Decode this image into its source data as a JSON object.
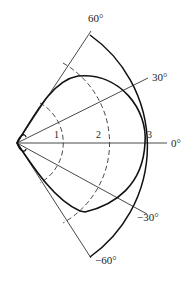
{
  "diagram": {
    "type": "polar radiation pattern",
    "origin": [
      17,
      143
    ],
    "angle_labels": [
      {
        "text": "60°",
        "angle": 60,
        "x": 88,
        "y": 22
      },
      {
        "text": "30°",
        "angle": 30,
        "x": 152,
        "y": 80
      },
      {
        "text": "0°",
        "angle": 0,
        "x": 171,
        "y": 148
      },
      {
        "text": "−30°",
        "angle": -30,
        "x": 137,
        "y": 221
      },
      {
        "text": "−60°",
        "angle": -60,
        "x": 95,
        "y": 263
      }
    ],
    "curve_labels": [
      {
        "text": "1",
        "x": 54,
        "y": 137
      },
      {
        "text": "2",
        "x": 96,
        "y": 137
      },
      {
        "text": "3",
        "x": 147,
        "y": 137
      }
    ],
    "colors": {
      "line": "#222222",
      "background": "#ffffff"
    }
  }
}
